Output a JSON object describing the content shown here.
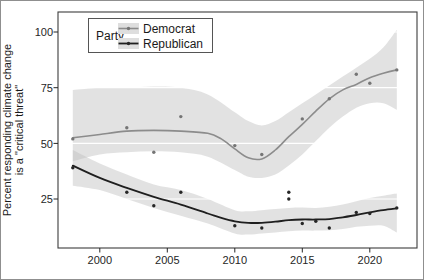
{
  "figure": {
    "frame_color": "#8f8f8f",
    "background": "#ffffff"
  },
  "chart_data": {
    "type": "line",
    "title": "",
    "ylabel_lines": [
      "Percent responding climate change",
      "is a \"critical threat\""
    ],
    "xlabel": "",
    "x_ticks": [
      "2000",
      "2005",
      "2010",
      "2015",
      "2020"
    ],
    "x_tick_values": [
      2000,
      2005,
      2010,
      2015,
      2020
    ],
    "y_ticks": [
      "100",
      "75",
      "50",
      "25"
    ],
    "y_tick_values": [
      100,
      75,
      50,
      25
    ],
    "x_range": [
      1996.9,
      2023.5
    ],
    "y_range": [
      3,
      109
    ],
    "grid": {
      "color": "#ffffff",
      "drawn_over_ribbons": true
    },
    "panel_border_color": "#3d3d3d",
    "tick_color": "#262626",
    "ribbon_color": "#bfbfbf",
    "ribbon_opacity": 0.45,
    "legend": {
      "title": "Party",
      "position": "top-left-inside",
      "entries": [
        "Democrat",
        "Republican"
      ],
      "swatch_fill": "#dedede",
      "border_color": "#555555"
    },
    "series": [
      {
        "name": "Democrat",
        "color": "#8c8c8c",
        "point_color": "#757575",
        "line_width": 1.6,
        "points": [
          [
            1998,
            52
          ],
          [
            2002,
            57
          ],
          [
            2004,
            46
          ],
          [
            2006,
            62
          ],
          [
            2010,
            49
          ],
          [
            2012,
            45
          ],
          [
            2015,
            61
          ],
          [
            2017,
            70
          ],
          [
            2019,
            81
          ],
          [
            2020,
            77
          ],
          [
            2022,
            83
          ]
        ],
        "trend": [
          [
            1998,
            52.5
          ],
          [
            2000,
            54
          ],
          [
            2002,
            55.5
          ],
          [
            2004,
            55.8
          ],
          [
            2006,
            55.5
          ],
          [
            2008,
            54.5
          ],
          [
            2009,
            52
          ],
          [
            2010,
            47.5
          ],
          [
            2011,
            43.5
          ],
          [
            2012,
            43
          ],
          [
            2013,
            47
          ],
          [
            2014,
            53
          ],
          [
            2015,
            58.5
          ],
          [
            2016,
            64.5
          ],
          [
            2017,
            70
          ],
          [
            2018,
            74
          ],
          [
            2019,
            76.5
          ],
          [
            2020,
            79.5
          ],
          [
            2021,
            81.5
          ],
          [
            2022,
            83
          ]
        ],
        "band": [
          [
            1998,
            42,
            74
          ],
          [
            2000,
            45,
            75
          ],
          [
            2002,
            46,
            75
          ],
          [
            2004,
            46.5,
            75.5
          ],
          [
            2006,
            46,
            75
          ],
          [
            2008,
            44,
            72
          ],
          [
            2010,
            38,
            64
          ],
          [
            2011,
            35,
            60
          ],
          [
            2012,
            34.5,
            58
          ],
          [
            2013,
            36,
            60
          ],
          [
            2014,
            40,
            64
          ],
          [
            2015,
            45,
            68
          ],
          [
            2016,
            51,
            72
          ],
          [
            2017,
            57,
            76
          ],
          [
            2018,
            62,
            80
          ],
          [
            2019,
            66,
            84
          ],
          [
            2020,
            68,
            88
          ],
          [
            2021,
            68,
            93
          ],
          [
            2022,
            65,
            101
          ]
        ]
      },
      {
        "name": "Republican",
        "color": "#1f1f1f",
        "point_color": "#262626",
        "line_width": 1.8,
        "points": [
          [
            1998,
            39
          ],
          [
            2002,
            28
          ],
          [
            2004,
            22
          ],
          [
            2006,
            28
          ],
          [
            2010,
            13
          ],
          [
            2012,
            12
          ],
          [
            2014,
            28
          ],
          [
            2014,
            25
          ],
          [
            2015,
            14
          ],
          [
            2016,
            15
          ],
          [
            2017,
            12
          ],
          [
            2019,
            19
          ],
          [
            2020,
            18.5
          ],
          [
            2022,
            21
          ]
        ],
        "trend": [
          [
            1998,
            40
          ],
          [
            2000,
            34.5
          ],
          [
            2002,
            30
          ],
          [
            2004,
            26
          ],
          [
            2006,
            22.5
          ],
          [
            2008,
            18.5
          ],
          [
            2009,
            16.5
          ],
          [
            2010,
            15
          ],
          [
            2011,
            14.3
          ],
          [
            2012,
            14.3
          ],
          [
            2013,
            14.8
          ],
          [
            2014,
            15.5
          ],
          [
            2015,
            15.8
          ],
          [
            2016,
            15.8
          ],
          [
            2017,
            16
          ],
          [
            2018,
            16.8
          ],
          [
            2019,
            17.8
          ],
          [
            2020,
            19
          ],
          [
            2021,
            20
          ],
          [
            2022,
            20.8
          ]
        ],
        "band": [
          [
            1998,
            31,
            47
          ],
          [
            2000,
            29,
            41
          ],
          [
            2002,
            25,
            36
          ],
          [
            2004,
            21,
            31.5
          ],
          [
            2006,
            17.5,
            29
          ],
          [
            2008,
            14,
            25
          ],
          [
            2010,
            9.5,
            20
          ],
          [
            2011,
            9,
            19.5
          ],
          [
            2012,
            9.5,
            20
          ],
          [
            2013,
            10,
            20.5
          ],
          [
            2014,
            10.5,
            21
          ],
          [
            2015,
            10.8,
            21.2
          ],
          [
            2016,
            10.8,
            21
          ],
          [
            2017,
            11,
            21.5
          ],
          [
            2018,
            11.5,
            22.5
          ],
          [
            2019,
            12.5,
            24
          ],
          [
            2020,
            13,
            25.5
          ],
          [
            2021,
            13,
            26.5
          ],
          [
            2022,
            10,
            27.5
          ]
        ]
      }
    ]
  }
}
